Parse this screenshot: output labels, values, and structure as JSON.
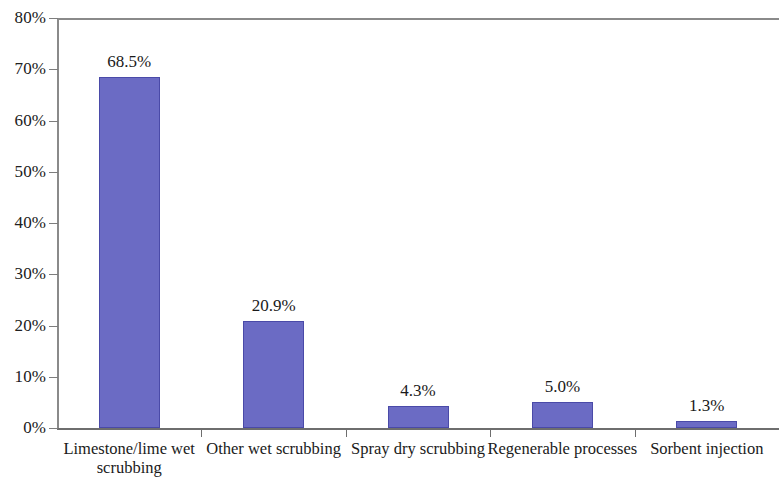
{
  "chart_data": {
    "type": "bar",
    "title": "",
    "subtitle": "",
    "xlabel": "",
    "ylabel": "",
    "categories": [
      "Limestone/lime wet scrubbing",
      "Other wet scrubbing",
      "Spray dry scrubbing",
      "Regenerable processes",
      "Sorbent injection"
    ],
    "values": [
      68.5,
      20.9,
      4.3,
      5.0,
      1.3
    ],
    "data_labels": [
      "68.5%",
      "20.9%",
      "4.3%",
      "5.0%",
      "1.3%"
    ],
    "ylim": [
      0,
      80
    ],
    "ytick_values": [
      0,
      10,
      20,
      30,
      40,
      50,
      60,
      70,
      80
    ],
    "ytick_labels": [
      "0%",
      "10%",
      "20%",
      "30%",
      "40%",
      "50%",
      "60%",
      "70%",
      "80%"
    ],
    "grid": false,
    "legend": false,
    "legend_position": "none",
    "bar_color": "#6B6BC4",
    "bar_border_color": "#4A4AA8",
    "axis_color": "#7A7A7A",
    "background_color": "#FFFFFF"
  },
  "axis": {
    "y_ticks": [
      {
        "label": "80%",
        "value": 80
      },
      {
        "label": "70%",
        "value": 70
      },
      {
        "label": "60%",
        "value": 60
      },
      {
        "label": "50%",
        "value": 50
      },
      {
        "label": "40%",
        "value": 40
      },
      {
        "label": "30%",
        "value": 30
      },
      {
        "label": "20%",
        "value": 20
      },
      {
        "label": "10%",
        "value": 10
      },
      {
        "label": "0%",
        "value": 0
      }
    ]
  },
  "categories_display": [
    {
      "line1": "Limestone/lime wet",
      "line2": "scrubbing"
    },
    {
      "line1": "Other wet scrubbing",
      "line2": ""
    },
    {
      "line1": "Spray dry scrubbing",
      "line2": ""
    },
    {
      "line1": "Regenerable processes",
      "line2": ""
    },
    {
      "line1": "Sorbent injection",
      "line2": ""
    }
  ]
}
